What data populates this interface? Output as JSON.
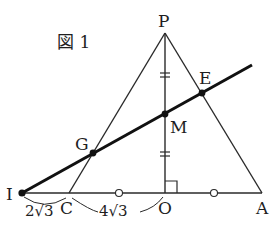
{
  "figure": {
    "title": "図 1",
    "stroke_color": "#2a2a2a",
    "points": {
      "P": {
        "label": "P",
        "x": 165,
        "y": 33
      },
      "E": {
        "label": "E",
        "x": 202,
        "y": 93
      },
      "M": {
        "label": "M",
        "x": 165,
        "y": 114
      },
      "G": {
        "label": "G",
        "x": 93,
        "y": 153
      },
      "I": {
        "label": "I",
        "x": 22,
        "y": 193
      },
      "C": {
        "label": "C",
        "x": 69,
        "y": 193
      },
      "O": {
        "label": "O",
        "x": 165,
        "y": 193
      },
      "A": {
        "label": "A",
        "x": 262,
        "y": 193
      }
    },
    "lengths": {
      "IC": "2√3",
      "CO": "4√3"
    },
    "markings": {
      "PM_equals_MO": "double-tick",
      "CO_equals_OA": "circle",
      "angle_POA": "right-angle"
    }
  }
}
